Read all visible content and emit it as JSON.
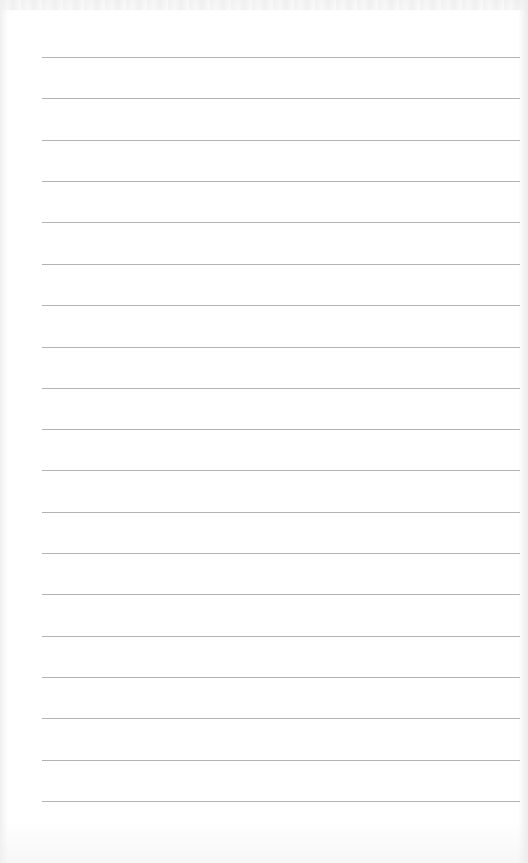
{
  "paper": {
    "style": "lined",
    "line_color": "#9a9a9a",
    "background_color": "#ffffff",
    "line_left": 42,
    "line_width": 478,
    "line_count": 19,
    "line_positions": [
      57,
      98,
      140,
      181,
      222,
      264,
      305,
      347,
      388,
      429,
      470,
      512,
      553,
      594,
      636,
      677,
      718,
      760,
      801
    ]
  }
}
